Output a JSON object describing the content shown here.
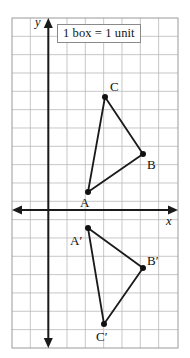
{
  "figure": {
    "legend_text": "1 box = 1 unit",
    "axis_labels": {
      "x": "x",
      "y": "y"
    },
    "colors": {
      "grid_line": "#b9b9b9",
      "grid_border": "#9a9a9a",
      "axis": "#1a1a1a",
      "shape_stroke": "#1a1a1a",
      "vertex_dot": "#111111",
      "background": "#ffffff",
      "label_text": "#101010"
    }
  },
  "grid": {
    "left_px": 12,
    "top_px": 18,
    "right_px": 178,
    "bottom_px": 348,
    "cell_px": 18.33,
    "columns": 9,
    "rows": 18,
    "origin_px": {
      "x": 48.3,
      "y": 210
    }
  },
  "chart_data": {
    "type": "scatter",
    "title": "1 box = 1 unit",
    "xlabel": "x",
    "ylabel": "y",
    "grid": true,
    "legend": "none",
    "xlim": [
      -2,
      7
    ],
    "ylim": [
      -7.5,
      10.5
    ],
    "unit_per_box": 1,
    "shapes": [
      {
        "name": "triangle-abc",
        "closed": true,
        "points": [
          {
            "label": "A",
            "x": 2.2,
            "y": 1.0,
            "px": 88,
            "py": 192,
            "label_px": 80,
            "label_py": 196
          },
          {
            "label": "B",
            "x": 5.2,
            "y": 3.1,
            "px": 143,
            "py": 154,
            "label_px": 147,
            "label_py": 158
          },
          {
            "label": "C",
            "x": 3.1,
            "y": 6.2,
            "px": 105,
            "py": 97,
            "label_px": 110,
            "label_py": 80
          }
        ]
      },
      {
        "name": "triangle-a-prime-b-prime-c-prime",
        "closed": true,
        "points": [
          {
            "label": "A′",
            "x": 2.2,
            "y": -1.0,
            "px": 88,
            "py": 228,
            "label_px": 70,
            "label_py": 234
          },
          {
            "label": "B′",
            "x": 5.2,
            "y": -3.1,
            "px": 143,
            "py": 268,
            "label_px": 147,
            "label_py": 254
          },
          {
            "label": "C′",
            "x": 3.1,
            "y": -6.2,
            "px": 104,
            "py": 324,
            "label_px": 96,
            "label_py": 330
          }
        ]
      }
    ]
  }
}
